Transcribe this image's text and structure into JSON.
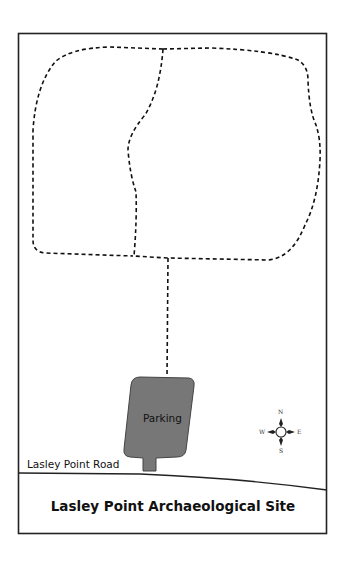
{
  "map": {
    "title": "Lasley Point Archaeological Site",
    "road_label": "Lasley Point Road",
    "parking_label": "Parking",
    "compass": {
      "n": "N",
      "s": "S",
      "e": "E",
      "w": "W"
    },
    "colors": {
      "border": "#222222",
      "trail": "#111111",
      "parking_fill": "#777777",
      "background": "#ffffff"
    },
    "icons": [
      "compass-rose-icon"
    ]
  }
}
